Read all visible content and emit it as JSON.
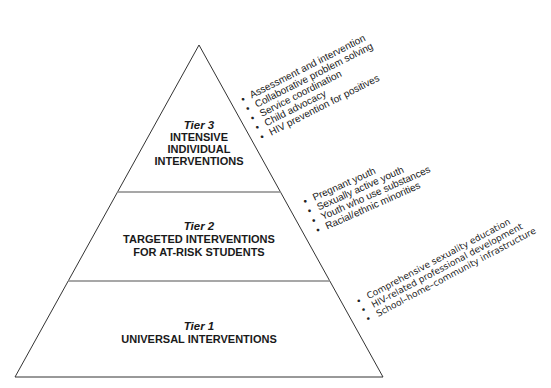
{
  "diagram": {
    "type": "pyramid",
    "colors": {
      "outline": "#333333",
      "divider": "#8a8a8a",
      "text": "#1a1a1a",
      "background": "#ffffff"
    },
    "tiers": [
      {
        "label": "Tier 3",
        "title_lines": [
          "INTENSIVE",
          "INDIVIDUAL",
          "INTERVENTIONS"
        ],
        "bullets": [
          "Assessment and intervention",
          "Collaborative problem solving",
          "Service coordination",
          "Child advocacy",
          "HIV prevention for positives"
        ]
      },
      {
        "label": "Tier 2",
        "title_lines": [
          "TARGETED INTERVENTIONS",
          "FOR AT-RISK STUDENTS"
        ],
        "bullets": [
          "Pregnant youth",
          "Sexually active youth",
          "Youth who use substances",
          "Racial/ethnic minorities"
        ]
      },
      {
        "label": "Tier 1",
        "title_lines": [
          "UNIVERSAL INTERVENTIONS"
        ],
        "bullets": [
          "Comprehensive sexuality education",
          "HIV-related professional development",
          "School–home–community infrastructure"
        ]
      }
    ],
    "bullet_glyph": "•"
  }
}
